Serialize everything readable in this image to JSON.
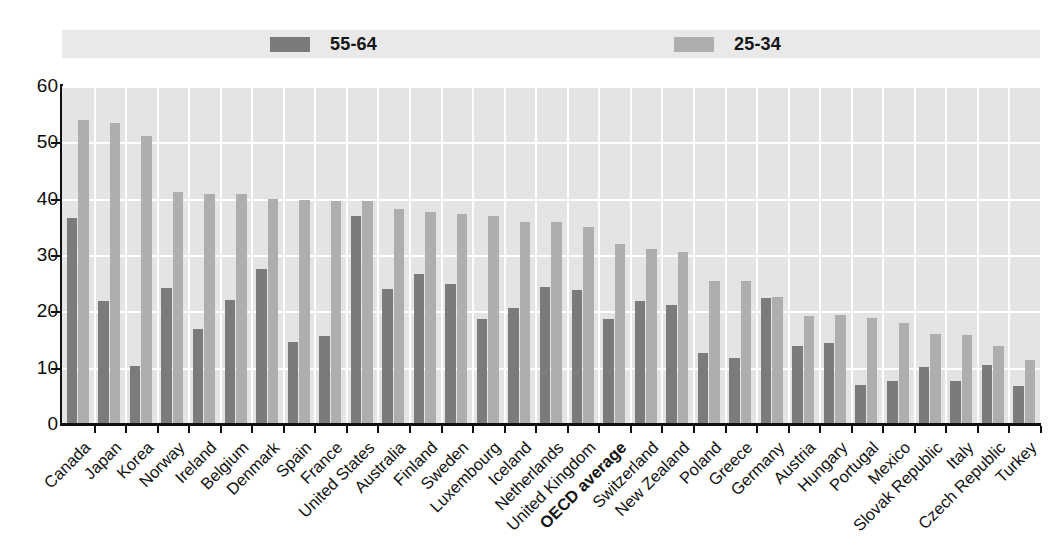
{
  "legend": {
    "entries": [
      {
        "label": "55-64",
        "color": "#7b7b7b",
        "swatch_name": "legend-swatch-55-64"
      },
      {
        "label": "25-34",
        "color": "#aeaeae",
        "swatch_name": "legend-swatch-25-34"
      }
    ],
    "background": "#e9e9e9"
  },
  "axis": {
    "y_ticks": [
      "60",
      "50",
      "40",
      "30",
      "20",
      "10",
      "0"
    ],
    "y_min": 0,
    "y_max": 60,
    "y_step": 10
  },
  "colors": {
    "series_55_64": "#7b7b7b",
    "series_25_34": "#aeaeae",
    "plot_background": "#e4e4e4",
    "gridline": "#ffffff",
    "axis": "#101010"
  },
  "chart_data": {
    "type": "bar",
    "title": "",
    "subtitle": "",
    "xlabel": "",
    "ylabel": "",
    "ylim": [
      0,
      60
    ],
    "ytick_step": 10,
    "grid": "horizontal-and-vertical white gridlines on grey panel",
    "legend_position": "top",
    "categories": [
      "Canada",
      "Japan",
      "Korea",
      "Norway",
      "Ireland",
      "Belgium",
      "Denmark",
      "Spain",
      "France",
      "United States",
      "Australia",
      "Finland",
      "Sweden",
      "Luxembourg",
      "Iceland",
      "Netherlands",
      "United Kingdom",
      "OECD average",
      "Switzerland",
      "New Zealand",
      "Poland",
      "Greece",
      "Germany",
      "Austria",
      "Hungary",
      "Portugal",
      "Mexico",
      "Slovak Republic",
      "Italy",
      "Czech Republic",
      "Turkey"
    ],
    "highlighted_category": "OECD average",
    "series": [
      {
        "name": "55-64",
        "color": "#7b7b7b",
        "values": [
          36.6,
          21.8,
          10.3,
          24.2,
          16.9,
          22.1,
          27.5,
          14.6,
          15.7,
          37.0,
          23.9,
          26.6,
          24.9,
          18.7,
          20.6,
          24.4,
          23.8,
          18.7,
          21.8,
          21.1,
          12.6,
          11.7,
          22.4,
          13.9,
          14.4,
          7.0,
          7.7,
          10.2,
          7.7,
          10.5,
          6.7
        ]
      },
      {
        "name": "25-34",
        "color": "#aeaeae",
        "values": [
          54.0,
          53.4,
          51.1,
          41.1,
          40.8,
          40.8,
          40.0,
          39.8,
          39.5,
          39.5,
          38.2,
          37.6,
          37.3,
          37.0,
          35.8,
          35.9,
          35.0,
          32.0,
          31.0,
          30.6,
          25.4,
          25.3,
          22.5,
          19.2,
          19.3,
          18.8,
          17.9,
          16.0,
          15.8,
          13.9,
          11.4
        ]
      }
    ]
  }
}
